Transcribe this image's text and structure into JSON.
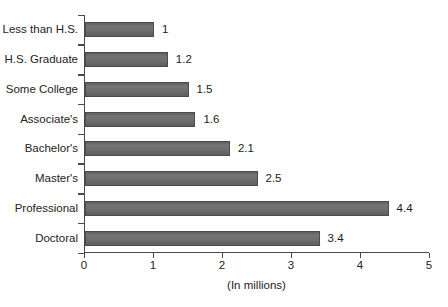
{
  "chart_data": {
    "type": "bar",
    "orientation": "horizontal",
    "title": "",
    "categories": [
      "Less than H.S.",
      "H.S. Graduate",
      "Some College",
      "Associate's",
      "Bachelor's",
      "Master's",
      "Professional",
      "Doctoral"
    ],
    "values": [
      1,
      1.2,
      1.5,
      1.6,
      2.1,
      2.5,
      4.4,
      3.4
    ],
    "value_labels": [
      "1",
      "1.2",
      "1.5",
      "1.6",
      "2.1",
      "2.5",
      "4.4",
      "3.4"
    ],
    "xlabel": "(In millions)",
    "ylabel": "",
    "x_ticks": [
      "0",
      "1",
      "2",
      "3",
      "4",
      "5"
    ],
    "xlim": [
      0,
      5
    ],
    "grid": false,
    "legend": "none",
    "bar_color": "#6d6d6d",
    "bar_border_color": "#4b4b4b",
    "axis_color": "#4a4a4a",
    "text_color": "#242424",
    "background_color": "#fefefe"
  }
}
